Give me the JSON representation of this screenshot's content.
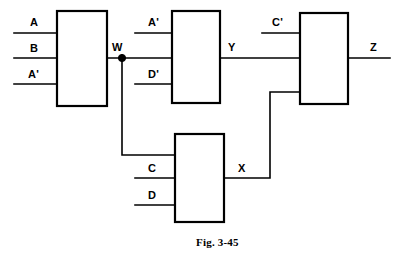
{
  "figure": {
    "caption": "Fig. 3-45",
    "caption_x": 196,
    "caption_y": 236
  },
  "diagram": {
    "width": 399,
    "height": 260,
    "background": "#ffffff",
    "line_color": "#000000"
  },
  "gates": [
    {
      "id": "gate-1",
      "x": 57,
      "y": 11,
      "w": 50,
      "h": 95,
      "output_signal": "W"
    },
    {
      "id": "gate-2",
      "x": 172,
      "y": 11,
      "w": 48,
      "h": 92,
      "output_signal": "Y"
    },
    {
      "id": "gate-3",
      "x": 300,
      "y": 13,
      "w": 48,
      "h": 91,
      "output_signal": "Z"
    },
    {
      "id": "gate-4",
      "x": 175,
      "y": 134,
      "w": 49,
      "h": 88,
      "output_signal": "X"
    }
  ],
  "labels": {
    "input_a": {
      "text": "A",
      "x": 30,
      "y": 17
    },
    "input_b": {
      "text": "B",
      "x": 30,
      "y": 43
    },
    "input_a_prime": {
      "text": "A'",
      "x": 28,
      "y": 69
    },
    "input_a2_prime": {
      "text": "A'",
      "x": 148,
      "y": 17
    },
    "input_d_prime": {
      "text": "D'",
      "x": 148,
      "y": 69
    },
    "input_c_prime": {
      "text": "C'",
      "x": 272,
      "y": 17
    },
    "input_c": {
      "text": "C",
      "x": 148,
      "y": 163
    },
    "input_d": {
      "text": "D",
      "x": 148,
      "y": 190
    },
    "node_w": {
      "text": "W",
      "x": 112,
      "y": 42
    },
    "node_y": {
      "text": "Y",
      "x": 228,
      "y": 42
    },
    "node_x": {
      "text": "X",
      "x": 238,
      "y": 163
    },
    "output_z": {
      "text": "Z",
      "x": 370,
      "y": 42
    }
  },
  "wires": {
    "input_a_line": "M14,33 L57,33",
    "input_b_line": "M14,58 L57,58",
    "input_a_prime_line": "M14,84 L57,84",
    "gate1_out_line": "M107,58 L172,58",
    "input_a2_prime_line": "M135,33 L172,33",
    "input_d_prime_line": "M135,84 L172,84",
    "gate2_out_line": "M220,58 L300,58",
    "input_c_prime_line": "M262,33 L300,33",
    "output_z_line": "M348,58 L390,58",
    "w_feedback_line": "M122,58 L122,155 L175,155",
    "input_c_line": "M135,178 L175,178",
    "input_d_line": "M135,205 L175,205",
    "x_feedback_line": "M224,178 L270,178 L270,92 L300,92",
    "junction_w": {
      "cx": 122,
      "cy": 58,
      "r": 3.6
    }
  }
}
